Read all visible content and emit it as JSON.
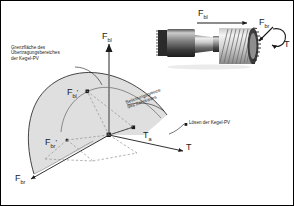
{
  "figure": {
    "name": "load-limit-diagram-cone-press-fit",
    "background": "#ffffff",
    "border_color": "#000000"
  },
  "annotations": {
    "boundary_note_line1": "Grenzfläche des",
    "boundary_note_line2": "Übertragungsbereiches",
    "boundary_note_line3": "der Kegel-PV",
    "gear_limit_line1": "Belastungsgrenze",
    "gear_limit_line2": "des Zahnrades",
    "release_note": "Lösen der Kegel-PV"
  },
  "axes": {
    "vertical": {
      "symbol": "F",
      "sub": "bl"
    },
    "right": {
      "symbol": "T",
      "sub": ""
    },
    "lower_left": {
      "symbol": "F",
      "sub": "br"
    }
  },
  "points": {
    "fbl_prime": {
      "symbol": "F",
      "sub": "bl",
      "prime": "'"
    },
    "fbr_prime": {
      "symbol": "F",
      "sub": "br",
      "prime": "'"
    },
    "ta": {
      "symbol": "T",
      "sub": "a"
    }
  },
  "inset": {
    "name": "helical-gear-shaft-photo",
    "label_axial_force": {
      "symbol": "F",
      "sub": "bl"
    },
    "label_radial_force": {
      "symbol": "F",
      "sub": "br"
    },
    "label_torque": {
      "symbol": "T",
      "sub": ""
    }
  },
  "colors": {
    "surface_fill": "#d9d9d9",
    "line": "#1a1a1a",
    "dashed": "#7a7a7a",
    "photo_dark": "#3a3a3a",
    "photo_mid": "#9a9a9a",
    "photo_light": "#e2e2e2"
  }
}
